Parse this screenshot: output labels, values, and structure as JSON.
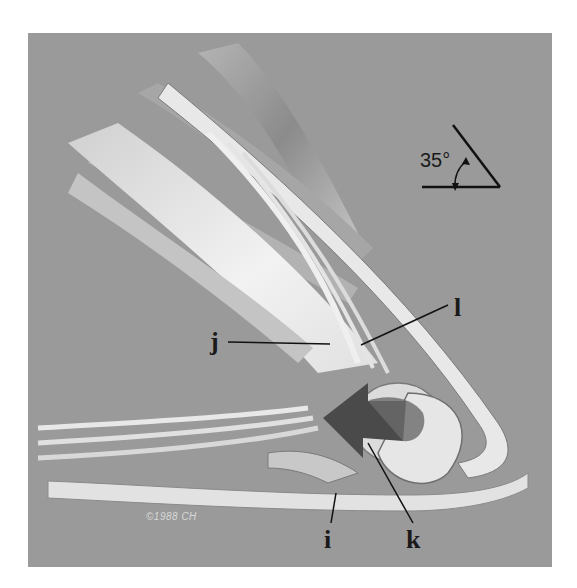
{
  "figure": {
    "background_color": "#9a9a9a",
    "angle_indicator": {
      "value_label": "35°"
    },
    "labels": [
      {
        "id": "i",
        "text": "i"
      },
      {
        "id": "j",
        "text": "j"
      },
      {
        "id": "k",
        "text": "k"
      },
      {
        "id": "l",
        "text": "l"
      }
    ],
    "copyright": "©1988 CH"
  }
}
